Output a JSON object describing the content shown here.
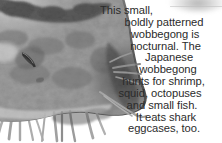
{
  "image": {
    "subject": "japanese-wobbegong-shark-head",
    "rendering": "grayscale-photograph",
    "alt": "Close-up grayscale photo of a boldly patterned wobbegong shark head with barbels along the lower jaw",
    "background_color": "#ffffff",
    "skin_dark": "#2c2c2c",
    "skin_mid": "#7a7a7a",
    "skin_light": "#cfcfcf",
    "barbel_color": "#8f8f8f"
  },
  "caption": {
    "text_color": "#2b2b2b",
    "alignment": "centered",
    "full_text": "This small, boldly patterned wobbegong is nocturnal. The Japanese wobbegong hunts for shrimp, squid, octopuses and small fish. It eats shark eggcases, too.",
    "lines": [
      "This small,",
      "boldly patterned",
      "wobbegong is",
      "nocturnal. The",
      "Japanese",
      "wobbegong",
      "hunts for shrimp,",
      "squid, octopuses",
      "and small fish.",
      "It eats shark",
      "eggcases, too."
    ]
  }
}
